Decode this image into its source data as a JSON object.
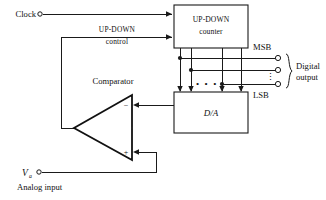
{
  "diagram": {
    "blocks": [
      {
        "id": "counter",
        "line1": "UP-DOWN",
        "line2": "counter"
      },
      {
        "id": "dac",
        "label": "D/A"
      },
      {
        "id": "comparator",
        "label": "Comparator"
      }
    ],
    "inputs": [
      {
        "id": "clock",
        "label": "Clock"
      },
      {
        "id": "updown",
        "line1": "UP-DOWN",
        "line2": "control"
      },
      {
        "id": "analog",
        "symbol": "V",
        "subscript": "a",
        "caption": "Analog input"
      }
    ],
    "outputs": {
      "msb_label": "MSB",
      "lsb_label": "LSB",
      "brace_line1": "Digital",
      "brace_line2": "output",
      "vertical_ellipsis": "⋮",
      "horizontal_ellipsis": "• • •"
    },
    "comparator_inputs": {
      "inverting": "−",
      "noninverting": "+"
    },
    "colors": {
      "ink": "#1a1a1a",
      "background": "#ffffff"
    }
  }
}
